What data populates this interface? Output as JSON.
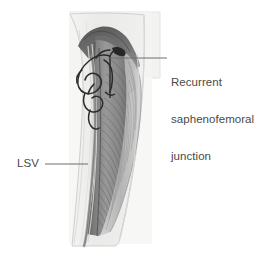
{
  "figure": {
    "type": "anatomical-illustration",
    "view": "medial thigh, longitudinal section",
    "background_color": "#ffffff"
  },
  "labels": [
    {
      "id": "sfj",
      "name": "recurrent-saphenofemoral-junction-label",
      "lines": [
        "Recurrent",
        "saphenofemoral",
        "junction"
      ],
      "text_color": "#4a4a4a",
      "leader": {
        "from_x": 110,
        "from_y": 58,
        "to_x": 167,
        "to_y": 58,
        "color": "#6e6e6e"
      }
    },
    {
      "id": "lsv",
      "name": "lsv-label",
      "lines": [
        "LSV"
      ],
      "text_color": "#4a4a4a",
      "leader": {
        "from_x": 45,
        "from_y": 164,
        "to_x": 88,
        "to_y": 164,
        "color": "#6e6e6e"
      }
    }
  ],
  "label_sfj_line1": "Recurrent",
  "label_sfj_line2": "saphenofemoral",
  "label_sfj_line3": "junction",
  "label_lsv": "LSV",
  "palette": {
    "panel_fill": "#f2f2f1",
    "panel_stroke": "#e2e2e1",
    "skin_fill": "#ececeb",
    "skin_stroke": "#cfcfce",
    "fascia_light": "#e4e4e3",
    "muscle_dark": "#6b6b6b",
    "muscle_mid": "#8d8d8d",
    "muscle_light": "#b4b4b4",
    "muscle_pale": "#cccccc",
    "vein_dark": "#2e2e2e",
    "vein_gray": "#9a9a9a",
    "leader_line": "#6e6e6e",
    "text": "#4a4a4a"
  },
  "structures": [
    {
      "name": "background-panel",
      "label": "light rectangular backdrop panel"
    },
    {
      "name": "thigh-outline",
      "label": "thigh skin contour"
    },
    {
      "name": "muscle-mass",
      "label": "striated thigh musculature"
    },
    {
      "name": "long-saphenous-vein",
      "label": "LSV running vertically in the subcutaneous plane"
    },
    {
      "name": "recurrent-varicose-network",
      "label": "tortuous recurrent veins at the saphenofemoral junction"
    },
    {
      "name": "groin-crease",
      "label": "dark proximal groin region"
    }
  ]
}
